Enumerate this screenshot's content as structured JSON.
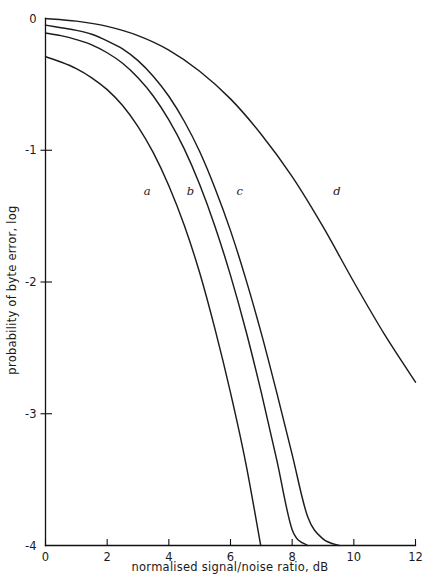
{
  "chart_data": {
    "type": "line",
    "title": "",
    "xlabel": "normalised signal/noise ratio, dB",
    "ylabel": "probability of byte error, log",
    "xlim": [
      0,
      12
    ],
    "ylim": [
      -4,
      0
    ],
    "grid": false,
    "legend_position": "inline-curve-labels",
    "xticks": [
      0,
      2,
      4,
      6,
      8,
      10,
      12
    ],
    "xtick_labels": [
      "0",
      "2",
      "4",
      "6",
      "8",
      "10",
      "12"
    ],
    "yticks": [
      0,
      -1,
      -2,
      -3,
      -4
    ],
    "ytick_labels": [
      "0",
      "-1",
      "-2",
      "-3",
      "-4"
    ],
    "annotations": [
      {
        "text": "a",
        "x": 3.3,
        "y": -1.34
      },
      {
        "text": "b",
        "x": 4.7,
        "y": -1.34
      },
      {
        "text": "c",
        "x": 6.3,
        "y": -1.34
      },
      {
        "text": "d",
        "x": 9.45,
        "y": -1.34
      }
    ],
    "series": [
      {
        "name": "a",
        "label": "a",
        "x": [
          0.0,
          0.5,
          1.0,
          1.5,
          2.0,
          2.5,
          3.0,
          3.5,
          4.0,
          4.5,
          5.0,
          5.5,
          6.0,
          6.5,
          6.98
        ],
        "y": [
          -0.29,
          -0.33,
          -0.38,
          -0.45,
          -0.54,
          -0.66,
          -0.82,
          -1.02,
          -1.27,
          -1.57,
          -1.93,
          -2.36,
          -2.84,
          -3.38,
          -4.0
        ]
      },
      {
        "name": "b",
        "label": "b",
        "x": [
          0.0,
          0.5,
          1.0,
          1.5,
          2.0,
          2.5,
          3.0,
          3.5,
          4.0,
          4.5,
          5.0,
          5.5,
          6.0,
          6.5,
          7.0,
          7.5,
          8.0,
          8.5
        ],
        "y": [
          -0.11,
          -0.13,
          -0.16,
          -0.2,
          -0.26,
          -0.34,
          -0.45,
          -0.59,
          -0.77,
          -0.99,
          -1.26,
          -1.58,
          -1.95,
          -2.37,
          -2.84,
          -3.35,
          -3.88,
          -4.0
        ]
      },
      {
        "name": "c",
        "label": "c",
        "x": [
          0.0,
          0.5,
          1.0,
          1.5,
          2.0,
          2.5,
          3.0,
          3.5,
          4.0,
          4.5,
          5.0,
          5.5,
          6.0,
          6.5,
          7.0,
          7.5,
          8.0,
          8.5,
          9.0,
          9.53
        ],
        "y": [
          -0.05,
          -0.07,
          -0.09,
          -0.12,
          -0.17,
          -0.23,
          -0.32,
          -0.44,
          -0.59,
          -0.78,
          -1.01,
          -1.29,
          -1.61,
          -1.98,
          -2.39,
          -2.84,
          -3.31,
          -3.78,
          -3.95,
          -4.0
        ]
      },
      {
        "name": "d",
        "label": "d",
        "x": [
          0.0,
          1.0,
          2.0,
          3.0,
          4.0,
          5.0,
          6.0,
          7.0,
          8.0,
          9.0,
          10.0,
          11.0,
          12.0
        ],
        "y": [
          0.0,
          -0.02,
          -0.06,
          -0.13,
          -0.24,
          -0.4,
          -0.61,
          -0.88,
          -1.2,
          -1.58,
          -2.0,
          -2.4,
          -2.76
        ]
      }
    ]
  },
  "axes": {
    "x_title": "normalised signal/noise ratio, dB",
    "y_title": "probability of byte error, log"
  }
}
